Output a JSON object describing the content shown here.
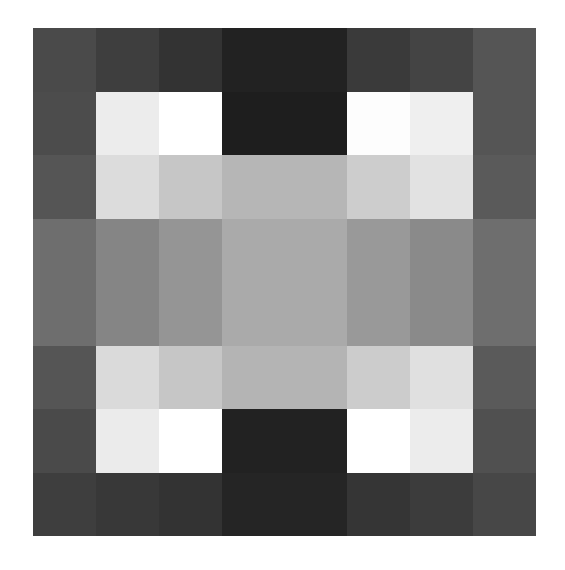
{
  "grid": {
    "rows": 8,
    "cols": 8,
    "cells": [
      [
        "#4a4a4a",
        "#3e3e3e",
        "#333333",
        "#222222",
        "#222222",
        "#3a3a3a",
        "#444444",
        "#555555"
      ],
      [
        "#4c4c4c",
        "#ececec",
        "#ffffff",
        "#1e1e1e",
        "#1e1e1e",
        "#fdfdfd",
        "#efefef",
        "#555555"
      ],
      [
        "#555555",
        "#dcdcdc",
        "#c6c6c6",
        "#b6b6b6",
        "#b6b6b6",
        "#cdcdcd",
        "#e2e2e2",
        "#5a5a5a"
      ],
      [
        "#6e6e6e",
        "#858585",
        "#959595",
        "#aaaaaa",
        "#aaaaaa",
        "#999999",
        "#8a8a8a",
        "#6e6e6e"
      ],
      [
        "#6e6e6e",
        "#858585",
        "#959595",
        "#aaaaaa",
        "#aaaaaa",
        "#999999",
        "#8a8a8a",
        "#6e6e6e"
      ],
      [
        "#555555",
        "#dadada",
        "#c6c6c6",
        "#b4b4b4",
        "#b4b4b4",
        "#cccccc",
        "#e0e0e0",
        "#5a5a5a"
      ],
      [
        "#4a4a4a",
        "#ebebeb",
        "#ffffff",
        "#222222",
        "#222222",
        "#ffffff",
        "#ececec",
        "#505050"
      ],
      [
        "#3e3e3e",
        "#383838",
        "#333333",
        "#252525",
        "#252525",
        "#353535",
        "#3c3c3c",
        "#474747"
      ]
    ]
  }
}
